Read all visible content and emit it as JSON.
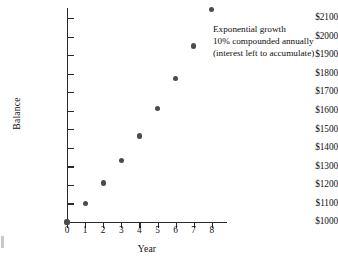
{
  "chart_data": {
    "type": "scatter",
    "title": "",
    "xlabel": "Year",
    "ylabel": "Balance",
    "x": [
      0,
      1,
      2,
      3,
      4,
      5,
      6,
      7,
      8
    ],
    "values": [
      1000,
      1100,
      1210,
      1331,
      1464,
      1611,
      1772,
      1949,
      2144
    ],
    "xlim": [
      0,
      8
    ],
    "ylim": [
      1000,
      2200
    ],
    "xticks": [
      "0",
      "1",
      "2",
      "3",
      "4",
      "5",
      "6",
      "7",
      "8"
    ],
    "yticks": [
      "$1000",
      "$1100",
      "$1200",
      "$1300",
      "$1400",
      "$1500",
      "$1600",
      "$1700",
      "$1800",
      "$1900",
      "$2000",
      "$2100"
    ],
    "ytick_values": [
      1000,
      1100,
      1200,
      1300,
      1400,
      1500,
      1600,
      1700,
      1800,
      1900,
      2000,
      2100
    ],
    "grid": false,
    "legend": "none",
    "marker_color": "#4a4a50",
    "axis_color": "#2a2a2a",
    "annotations": [
      "Exponential growth",
      "10% compounded annually",
      "(interest left to accumulate)"
    ]
  },
  "axes": {
    "y_title": "Balance",
    "x_title": "Year"
  }
}
